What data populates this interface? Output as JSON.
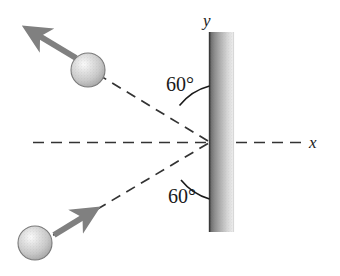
{
  "figure": {
    "type": "physics-diagram",
    "background_color": "#ffffff"
  },
  "axes": {
    "x_label": "x",
    "y_label": "y",
    "x_axis": {
      "style": "dashed",
      "color": "#333333",
      "y_position": 142,
      "x_start": 33,
      "x_end": 305
    },
    "origin": {
      "x": 210,
      "y": 142
    }
  },
  "wall": {
    "name": "wall",
    "left": 209,
    "top": 32,
    "width": 25,
    "height": 200,
    "gradient_dark": "#5a5a5a",
    "gradient_light": "#e8e8e8",
    "edge_color": "#3c3c3c"
  },
  "angles": [
    {
      "label": "60°",
      "value": 60,
      "unit": "degrees",
      "position": "upper",
      "x": 166,
      "y": 91,
      "measured_from": "y-axis/wall-normal-surface"
    },
    {
      "label": "60°",
      "value": 60,
      "unit": "degrees",
      "position": "lower",
      "x": 168,
      "y": 203,
      "measured_from": "y-axis/wall-normal-surface"
    }
  ],
  "balls": [
    {
      "name": "ball-outgoing",
      "position": "upper-left",
      "cx": 88,
      "cy": 70,
      "r": 17,
      "fill_light": "#f2f2f2",
      "fill_mid": "#cccccc",
      "fill_dark": "#9a9a9a",
      "edge_color": "#6e6e6e"
    },
    {
      "name": "ball-incoming",
      "position": "lower-left",
      "cx": 35,
      "cy": 243,
      "r": 17,
      "fill_light": "#f2f2f2",
      "fill_mid": "#cccccc",
      "fill_dark": "#9a9a9a",
      "edge_color": "#6e6e6e"
    }
  ],
  "velocity_arrows": [
    {
      "name": "outgoing-velocity-arrow",
      "from": {
        "x": 76,
        "y": 58
      },
      "to": {
        "x": 22,
        "y": 25
      },
      "color": "#808080",
      "thickness": 6,
      "direction": "up-left"
    },
    {
      "name": "incoming-velocity-arrow",
      "from": {
        "x": 54,
        "y": 235
      },
      "to": {
        "x": 101,
        "y": 206
      },
      "color": "#808080",
      "thickness": 6,
      "direction": "up-right"
    }
  ],
  "trajectories": [
    {
      "name": "outgoing-trajectory-dashed",
      "from": {
        "x": 210,
        "y": 142
      },
      "to": {
        "x": 100,
        "y": 76
      },
      "style": "dashed",
      "color": "#333333"
    },
    {
      "name": "incoming-trajectory-dashed",
      "from": {
        "x": 210,
        "y": 142
      },
      "to": {
        "x": 48,
        "y": 238
      },
      "style": "dashed",
      "color": "#333333"
    }
  ],
  "arcs": [
    {
      "name": "upper-angle-arc",
      "color": "#1a1a1a"
    },
    {
      "name": "lower-angle-arc",
      "color": "#1a1a1a"
    }
  ]
}
